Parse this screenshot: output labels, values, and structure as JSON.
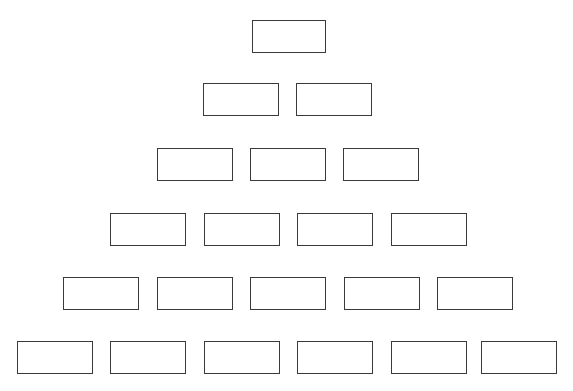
{
  "document": {
    "title": "Blank Pyramid Diagram",
    "background_color": "#ffffff",
    "stroke_color": "#3a3a3c",
    "fill_color": "#ffffff",
    "width": 573,
    "height": 391
  },
  "diagram": {
    "type": "pyramid-of-blank-boxes",
    "row_count": 6,
    "total_boxes": 21,
    "box_width": 76,
    "box_height": 33,
    "rows": [
      {
        "index": 1,
        "box_count": 1,
        "top": 20,
        "boxes": [
          {
            "label": "",
            "left": 252,
            "width": 74,
            "height": 33
          }
        ]
      },
      {
        "index": 2,
        "box_count": 2,
        "top": 83,
        "boxes": [
          {
            "label": "",
            "left": 203,
            "width": 76,
            "height": 33
          },
          {
            "label": "",
            "left": 296,
            "width": 76,
            "height": 33
          }
        ]
      },
      {
        "index": 3,
        "box_count": 3,
        "top": 148,
        "boxes": [
          {
            "label": "",
            "left": 157,
            "width": 76,
            "height": 33
          },
          {
            "label": "",
            "left": 250,
            "width": 76,
            "height": 33
          },
          {
            "label": "",
            "left": 343,
            "width": 76,
            "height": 33
          }
        ]
      },
      {
        "index": 4,
        "box_count": 4,
        "top": 213,
        "boxes": [
          {
            "label": "",
            "left": 110,
            "width": 76,
            "height": 33
          },
          {
            "label": "",
            "left": 204,
            "width": 76,
            "height": 33
          },
          {
            "label": "",
            "left": 297,
            "width": 76,
            "height": 33
          },
          {
            "label": "",
            "left": 391,
            "width": 76,
            "height": 33
          }
        ]
      },
      {
        "index": 5,
        "box_count": 5,
        "top": 277,
        "boxes": [
          {
            "label": "",
            "left": 63,
            "width": 76,
            "height": 33
          },
          {
            "label": "",
            "left": 157,
            "width": 76,
            "height": 33
          },
          {
            "label": "",
            "left": 250,
            "width": 76,
            "height": 33
          },
          {
            "label": "",
            "left": 344,
            "width": 76,
            "height": 33
          },
          {
            "label": "",
            "left": 437,
            "width": 76,
            "height": 33
          }
        ]
      },
      {
        "index": 6,
        "box_count": 6,
        "top": 341,
        "boxes": [
          {
            "label": "",
            "left": 17,
            "width": 76,
            "height": 33
          },
          {
            "label": "",
            "left": 110,
            "width": 76,
            "height": 33
          },
          {
            "label": "",
            "left": 204,
            "width": 76,
            "height": 33
          },
          {
            "label": "",
            "left": 297,
            "width": 76,
            "height": 33
          },
          {
            "label": "",
            "left": 391,
            "width": 76,
            "height": 33
          },
          {
            "label": "",
            "left": 481,
            "width": 76,
            "height": 33
          }
        ]
      }
    ]
  }
}
